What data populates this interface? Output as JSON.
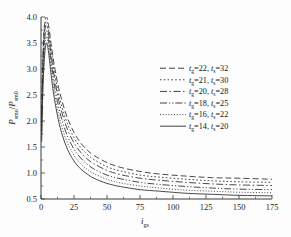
{
  "chart_data": {
    "type": "line",
    "title": "",
    "subtitle": "",
    "xlabel": "i_gs",
    "xlabel_base": "i",
    "xlabel_sub": "gs",
    "ylabel": "P_smo/P_sm0",
    "ylabel_num_base": "P",
    "ylabel_num_sub": "smo",
    "ylabel_den_base": "P",
    "ylabel_den_sub": "sm0",
    "xlim": [
      0,
      175
    ],
    "ylim": [
      0.5,
      4.0
    ],
    "xticks": [
      0,
      25,
      50,
      75,
      100,
      125,
      150,
      175
    ],
    "xticklabels": [
      "0",
      "25",
      "50",
      "75",
      "100",
      "125",
      "150",
      "175"
    ],
    "yticks": [
      0.5,
      1.0,
      1.5,
      2.0,
      2.5,
      3.0,
      3.5,
      4.0
    ],
    "yticklabels": [
      "0.5",
      "1.0",
      "1.5",
      "2.0",
      "2.5",
      "3.0",
      "3.5",
      "4.0"
    ],
    "grid": false,
    "legend_position": "center-right",
    "series": [
      {
        "name": "tg=22, ts=32",
        "tg": 22,
        "ts": 32,
        "linestyle": "dashed",
        "dasharray": "6,3",
        "asymptote": 0.88,
        "peak": 4.0,
        "x": [
          0.5,
          1,
          2,
          3,
          4,
          5,
          6,
          8,
          10,
          13,
          16,
          20,
          25,
          30,
          35,
          40,
          50,
          60,
          75,
          90,
          110,
          130,
          150,
          175
        ],
        "y": [
          2.05,
          2.85,
          3.62,
          3.92,
          4.0,
          3.95,
          3.8,
          3.42,
          3.08,
          2.68,
          2.38,
          2.06,
          1.78,
          1.58,
          1.44,
          1.34,
          1.2,
          1.11,
          1.03,
          0.98,
          0.94,
          0.91,
          0.9,
          0.88
        ]
      },
      {
        "name": "tg=21, ts=30",
        "tg": 21,
        "ts": 30,
        "linestyle": "dotted",
        "dasharray": "1.6,2.2",
        "asymptote": 0.82,
        "peak": 3.92,
        "x": [
          0.5,
          1,
          2,
          3,
          4,
          5,
          6,
          8,
          10,
          13,
          16,
          20,
          25,
          30,
          35,
          40,
          50,
          60,
          75,
          90,
          110,
          130,
          150,
          175
        ],
        "y": [
          1.98,
          2.76,
          3.52,
          3.84,
          3.92,
          3.86,
          3.7,
          3.31,
          2.96,
          2.56,
          2.26,
          1.95,
          1.68,
          1.49,
          1.36,
          1.26,
          1.12,
          1.04,
          0.96,
          0.92,
          0.88,
          0.85,
          0.83,
          0.82
        ]
      },
      {
        "name": "tg=20, ts=28",
        "tg": 20,
        "ts": 28,
        "linestyle": "dashdot",
        "dasharray": "7,2.5,1.5,2.5",
        "asymptote": 0.76,
        "peak": 3.85,
        "x": [
          0.5,
          1,
          2,
          3,
          4,
          5,
          6,
          8,
          10,
          13,
          16,
          20,
          25,
          30,
          35,
          40,
          50,
          60,
          75,
          90,
          110,
          130,
          150,
          175
        ],
        "y": [
          1.9,
          2.66,
          3.42,
          3.76,
          3.85,
          3.78,
          3.62,
          3.21,
          2.86,
          2.45,
          2.15,
          1.84,
          1.58,
          1.4,
          1.27,
          1.18,
          1.05,
          0.97,
          0.9,
          0.86,
          0.82,
          0.79,
          0.77,
          0.76
        ]
      },
      {
        "name": "tg=18, ts=25",
        "tg": 18,
        "ts": 25,
        "linestyle": "dashdotdot",
        "dasharray": "7,2,1.2,2,1.2,2",
        "asymptote": 0.68,
        "peak": 3.74,
        "x": [
          0.5,
          1,
          2,
          3,
          4,
          5,
          6,
          8,
          10,
          13,
          16,
          20,
          25,
          30,
          35,
          40,
          50,
          60,
          75,
          90,
          110,
          130,
          150,
          175
        ],
        "y": [
          1.8,
          2.52,
          3.28,
          3.63,
          3.74,
          3.67,
          3.5,
          3.08,
          2.72,
          2.31,
          2.01,
          1.71,
          1.46,
          1.29,
          1.17,
          1.08,
          0.96,
          0.89,
          0.82,
          0.78,
          0.74,
          0.71,
          0.69,
          0.68
        ]
      },
      {
        "name": "tg=16, ts=22",
        "tg": 16,
        "ts": 22,
        "linestyle": "finedotted",
        "dasharray": "1,1.8",
        "asymptote": 0.62,
        "peak": 3.62,
        "x": [
          0.5,
          1,
          2,
          3,
          4,
          5,
          6,
          8,
          10,
          13,
          16,
          20,
          25,
          30,
          35,
          40,
          50,
          60,
          75,
          90,
          110,
          130,
          150,
          175
        ],
        "y": [
          1.7,
          2.38,
          3.12,
          3.48,
          3.62,
          3.55,
          3.38,
          2.95,
          2.58,
          2.17,
          1.87,
          1.58,
          1.34,
          1.18,
          1.07,
          0.99,
          0.88,
          0.81,
          0.75,
          0.71,
          0.67,
          0.65,
          0.63,
          0.62
        ]
      },
      {
        "name": "tg=14, ts=20",
        "tg": 14,
        "ts": 20,
        "linestyle": "solid",
        "dasharray": "",
        "asymptote": 0.56,
        "peak": 3.5,
        "x": [
          0.5,
          1,
          2,
          3,
          4,
          5,
          6,
          8,
          10,
          13,
          16,
          20,
          25,
          30,
          35,
          40,
          50,
          60,
          75,
          90,
          110,
          130,
          150,
          175
        ],
        "y": [
          1.6,
          2.24,
          2.96,
          3.34,
          3.5,
          3.44,
          3.26,
          2.82,
          2.45,
          2.04,
          1.74,
          1.46,
          1.23,
          1.08,
          0.98,
          0.9,
          0.8,
          0.74,
          0.68,
          0.65,
          0.61,
          0.59,
          0.57,
          0.56
        ]
      }
    ]
  },
  "legend": {
    "entries": [
      {
        "var1": "t",
        "sub1": "g",
        "val1": "=22,",
        "var2": "t",
        "sub2": "s",
        "val2": "=32"
      },
      {
        "var1": "t",
        "sub1": "g",
        "val1": "=21,",
        "var2": "t",
        "sub2": "s",
        "val2": "=30"
      },
      {
        "var1": "t",
        "sub1": "g",
        "val1": "=20,",
        "var2": "t",
        "sub2": "s",
        "val2": "=28"
      },
      {
        "var1": "t",
        "sub1": "g",
        "val1": "=18,",
        "var2": "t",
        "sub2": "s",
        "val2": "=25"
      },
      {
        "var1": "t",
        "sub1": "g",
        "val1": "=16,",
        "var2": "t",
        "sub2": "s",
        "val2": "=22"
      },
      {
        "var1": "t",
        "sub1": "g",
        "val1": "=14,",
        "var2": "t",
        "sub2": "s",
        "val2": "=20"
      }
    ]
  },
  "colors": {
    "line": "#2b2b2b",
    "axis": "#3a3a3a",
    "text": "#141414",
    "background": "#fdfdfd"
  }
}
